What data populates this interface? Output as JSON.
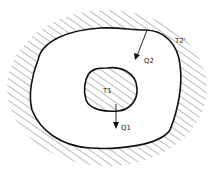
{
  "diagram": {
    "type": "heat-transfer-cavity",
    "labels": {
      "outer_temp": "T2'",
      "outer_flux": "Q2",
      "inner_temp": "T1",
      "inner_flux": "Q1"
    },
    "colors": {
      "stroke": "#111111",
      "hatch": "#555555",
      "background": "#ffffff"
    }
  }
}
